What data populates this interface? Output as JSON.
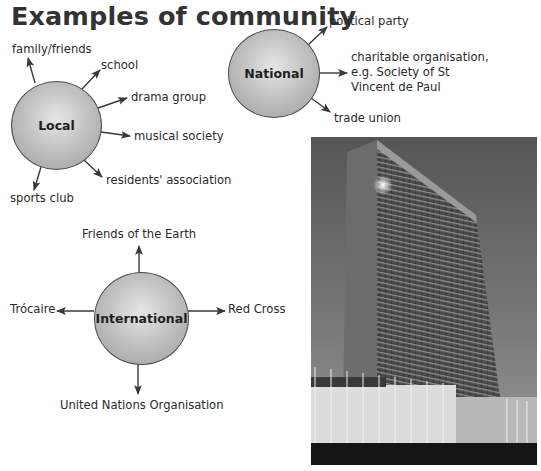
{
  "title": "Examples of community",
  "local": {
    "label": "Local",
    "items": [
      "family/friends",
      "school",
      "drama group",
      "musical society",
      "residents' association",
      "sports club"
    ]
  },
  "national": {
    "label": "National",
    "items": [
      "political party",
      "charitable organisation,",
      "e.g. Society of St",
      "Vincent de Paul",
      "trade union"
    ]
  },
  "international": {
    "label": "International",
    "items": [
      "Friends of the Earth",
      "Red Cross",
      "United Nations Organisation",
      "Trócaire"
    ]
  },
  "photo": {
    "subject": "United Nations headquarters building"
  },
  "colors": {
    "circle_fill": "#b8b8b8",
    "circle_border": "#4a4a4a",
    "arrow": "#3a3a3a",
    "text": "#2a2a2a"
  }
}
